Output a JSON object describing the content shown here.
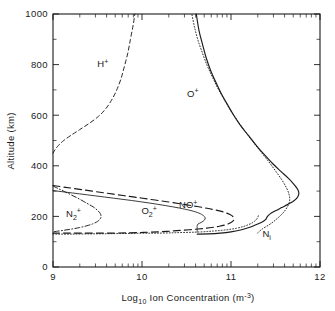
{
  "figure": {
    "background": "#ffffff",
    "ink": "#1a1a1a"
  },
  "axes": {
    "x_title_parts": {
      "main1": "Log",
      "sub1": "10",
      "main2": " Ion Concentration (m",
      "sup2": "-3",
      "main3": ")"
    },
    "x_title_full": "Log10 Ion Concentration (m-3)",
    "y_title": "Altitude (km)",
    "x_ticklabels": [
      "9",
      "10",
      "11",
      "12"
    ],
    "y_ticklabels": [
      "0",
      "200",
      "400",
      "600",
      "800",
      "1000"
    ]
  },
  "labels": {
    "h_plus": {
      "base": "H",
      "sup": "+"
    },
    "o_plus": {
      "base": "O",
      "sup": "+"
    },
    "no_plus": {
      "base": "NO",
      "sup": "+"
    },
    "n2_plus": {
      "base": "N",
      "sub": "2",
      "sup": "+"
    },
    "o2_plus": {
      "base": "O",
      "sub": "2",
      "sup": "+"
    },
    "ni": {
      "base": "N",
      "sub": "i"
    }
  },
  "chart_data": {
    "type": "line",
    "title": "",
    "xlabel": "Log10 Ion Concentration (m-3)",
    "ylabel": "Altitude (km)",
    "xlim": [
      9,
      12
    ],
    "ylim": [
      0,
      1000
    ],
    "xscale": "log-decade-linear",
    "yscale": "linear",
    "xticks": [
      9,
      10,
      11,
      12
    ],
    "yticks": [
      0,
      200,
      400,
      600,
      800,
      1000
    ],
    "grid": false,
    "legend": "inline-annotations",
    "minor_ticks": "logarithmic decade subdivisions on top and bottom axes",
    "series": [
      {
        "name": "H+",
        "label": "H+",
        "linestyle": "dashed",
        "label_xy": [
          9.56,
          790
        ],
        "points": [
          [
            9.0,
            450
          ],
          [
            9.02,
            462
          ],
          [
            9.06,
            480
          ],
          [
            9.12,
            500
          ],
          [
            9.2,
            520
          ],
          [
            9.3,
            543
          ],
          [
            9.4,
            566
          ],
          [
            9.5,
            592
          ],
          [
            9.58,
            620
          ],
          [
            9.65,
            655
          ],
          [
            9.71,
            695
          ],
          [
            9.76,
            740
          ],
          [
            9.8,
            790
          ],
          [
            9.84,
            845
          ],
          [
            9.87,
            900
          ],
          [
            9.9,
            955
          ],
          [
            9.92,
            1000
          ]
        ]
      },
      {
        "name": "O+",
        "label": "O+",
        "linestyle": "dotted",
        "label_xy": [
          10.57,
          672
        ],
        "points": [
          [
            11.3,
            135
          ],
          [
            11.35,
            150
          ],
          [
            11.42,
            165
          ],
          [
            11.48,
            180
          ],
          [
            11.53,
            195
          ],
          [
            11.58,
            212
          ],
          [
            11.62,
            230
          ],
          [
            11.65,
            250
          ],
          [
            11.66,
            268
          ],
          [
            11.65,
            290
          ],
          [
            11.62,
            315
          ],
          [
            11.57,
            345
          ],
          [
            11.5,
            380
          ],
          [
            11.42,
            418
          ],
          [
            11.33,
            458
          ],
          [
            11.24,
            498
          ],
          [
            11.15,
            540
          ],
          [
            11.07,
            580
          ],
          [
            10.99,
            622
          ],
          [
            10.92,
            664
          ],
          [
            10.85,
            708
          ],
          [
            10.79,
            752
          ],
          [
            10.73,
            798
          ],
          [
            10.68,
            845
          ],
          [
            10.63,
            895
          ],
          [
            10.59,
            948
          ],
          [
            10.56,
            1000
          ]
        ]
      },
      {
        "name": "Ni",
        "label": "Ni",
        "linestyle": "solid",
        "label_xy": [
          11.4,
          118
        ],
        "points": [
          [
            10.62,
            130
          ],
          [
            10.75,
            131
          ],
          [
            10.88,
            134
          ],
          [
            11.0,
            139
          ],
          [
            11.12,
            147
          ],
          [
            11.22,
            158
          ],
          [
            11.3,
            170
          ],
          [
            11.36,
            180
          ],
          [
            11.39,
            188
          ],
          [
            11.4,
            194
          ],
          [
            11.41,
            200
          ],
          [
            11.44,
            210
          ],
          [
            11.5,
            222
          ],
          [
            11.57,
            235
          ],
          [
            11.64,
            248
          ],
          [
            11.7,
            260
          ],
          [
            11.74,
            272
          ],
          [
            11.76,
            285
          ],
          [
            11.76,
            298
          ],
          [
            11.74,
            312
          ],
          [
            11.7,
            330
          ],
          [
            11.64,
            352
          ],
          [
            11.56,
            378
          ],
          [
            11.47,
            408
          ],
          [
            11.38,
            442
          ],
          [
            11.29,
            478
          ],
          [
            11.2,
            518
          ],
          [
            11.11,
            558
          ],
          [
            11.03,
            600
          ],
          [
            10.96,
            642
          ],
          [
            10.89,
            686
          ],
          [
            10.83,
            730
          ],
          [
            10.77,
            778
          ],
          [
            10.72,
            828
          ],
          [
            10.68,
            880
          ],
          [
            10.64,
            935
          ],
          [
            10.61,
            1000
          ]
        ]
      },
      {
        "name": "NO+",
        "label": "NO+",
        "linestyle": "long-dash",
        "label_xy": [
          10.52,
          232
        ],
        "points": [
          [
            9.0,
            322
          ],
          [
            9.14,
            315
          ],
          [
            9.3,
            307
          ],
          [
            9.48,
            298
          ],
          [
            9.68,
            288
          ],
          [
            9.88,
            278
          ],
          [
            10.08,
            268
          ],
          [
            10.28,
            258
          ],
          [
            10.46,
            248
          ],
          [
            10.62,
            239
          ],
          [
            10.76,
            230
          ],
          [
            10.88,
            221
          ],
          [
            10.96,
            212
          ],
          [
            11.01,
            203
          ],
          [
            11.03,
            194
          ],
          [
            11.03,
            185
          ],
          [
            11.0,
            176
          ],
          [
            10.95,
            168
          ],
          [
            10.87,
            161
          ],
          [
            10.76,
            155
          ],
          [
            10.63,
            150
          ],
          [
            10.48,
            146
          ],
          [
            10.33,
            142
          ],
          [
            10.18,
            139
          ],
          [
            10.02,
            137
          ],
          [
            9.86,
            135
          ],
          [
            9.68,
            134
          ],
          [
            9.5,
            134
          ],
          [
            9.32,
            134
          ],
          [
            9.16,
            134
          ],
          [
            9.0,
            134
          ]
        ]
      },
      {
        "name": "O2+",
        "label": "O2+",
        "linestyle": "thin-solid",
        "label_xy": [
          10.08,
          208
        ],
        "points": [
          [
            9.0,
            302
          ],
          [
            9.14,
            296
          ],
          [
            9.3,
            289
          ],
          [
            9.48,
            281
          ],
          [
            9.68,
            272
          ],
          [
            9.88,
            263
          ],
          [
            10.08,
            253
          ],
          [
            10.26,
            243
          ],
          [
            10.42,
            233
          ],
          [
            10.55,
            223
          ],
          [
            10.64,
            213
          ],
          [
            10.69,
            203
          ],
          [
            10.71,
            194
          ],
          [
            10.7,
            185
          ],
          [
            10.67,
            177
          ],
          [
            10.63,
            170
          ],
          [
            10.62,
            163
          ],
          [
            10.62,
            157
          ],
          [
            10.62,
            150
          ],
          [
            10.62,
            144
          ],
          [
            10.62,
            138
          ]
        ]
      },
      {
        "name": "N2+",
        "label": "N2+",
        "linestyle": "dash-dot",
        "label_xy": [
          9.23,
          198
        ],
        "points": [
          [
            9.0,
            320
          ],
          [
            9.06,
            310
          ],
          [
            9.13,
            298
          ],
          [
            9.21,
            284
          ],
          [
            9.3,
            268
          ],
          [
            9.38,
            252
          ],
          [
            9.45,
            238
          ],
          [
            9.5,
            224
          ],
          [
            9.53,
            212
          ],
          [
            9.54,
            200
          ],
          [
            9.53,
            190
          ],
          [
            9.5,
            180
          ],
          [
            9.45,
            171
          ],
          [
            9.38,
            163
          ],
          [
            9.3,
            156
          ],
          [
            9.21,
            150
          ],
          [
            9.12,
            145
          ],
          [
            9.04,
            141
          ],
          [
            9.0,
            138
          ],
          [
            9.0,
            136
          ]
        ]
      },
      {
        "name": "lower-dotted",
        "label": "",
        "linestyle": "dotted",
        "label_xy": null,
        "points": [
          [
            9.0,
            130
          ],
          [
            9.2,
            130
          ],
          [
            9.45,
            131
          ],
          [
            9.7,
            132
          ],
          [
            9.95,
            133
          ],
          [
            10.2,
            134
          ],
          [
            10.42,
            136
          ],
          [
            10.62,
            138
          ],
          [
            10.8,
            142
          ],
          [
            10.95,
            147
          ],
          [
            11.06,
            153
          ],
          [
            11.14,
            160
          ],
          [
            11.2,
            168
          ],
          [
            11.25,
            177
          ],
          [
            11.28,
            186
          ],
          [
            11.3,
            196
          ],
          [
            11.31,
            205
          ]
        ]
      }
    ]
  }
}
